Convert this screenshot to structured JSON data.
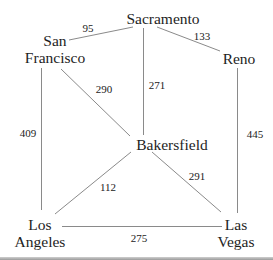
{
  "diagram": {
    "type": "weighted-graph",
    "nodes": {
      "sacramento": {
        "line1": "Sacramento",
        "line2": ""
      },
      "san_francisco": {
        "line1": "San",
        "line2": "Francisco"
      },
      "reno": {
        "line1": "Reno",
        "line2": ""
      },
      "bakersfield": {
        "line1": "Bakersfield",
        "line2": ""
      },
      "los_angeles": {
        "line1": "Los",
        "line2": "Angeles"
      },
      "las_vegas": {
        "line1": "Las",
        "line2": "Vegas"
      }
    },
    "edges": {
      "sf_sac": {
        "from": "San Francisco",
        "to": "Sacramento",
        "weight": "95"
      },
      "sac_reno": {
        "from": "Sacramento",
        "to": "Reno",
        "weight": "133"
      },
      "sf_bak": {
        "from": "San Francisco",
        "to": "Bakersfield",
        "weight": "290"
      },
      "sac_bak": {
        "from": "Sacramento",
        "to": "Bakersfield",
        "weight": "271"
      },
      "sf_la": {
        "from": "San Francisco",
        "to": "Los Angeles",
        "weight": "409"
      },
      "reno_lv": {
        "from": "Reno",
        "to": "Las Vegas",
        "weight": "445"
      },
      "la_bak": {
        "from": "Los Angeles",
        "to": "Bakersfield",
        "weight": "112"
      },
      "bak_lv": {
        "from": "Bakersfield",
        "to": "Las Vegas",
        "weight": "291"
      },
      "la_lv": {
        "from": "Los Angeles",
        "to": "Las Vegas",
        "weight": "275"
      }
    },
    "colors": {
      "edge": "#8a8a8a",
      "text": "#1e1e1e",
      "background": "#ffffff"
    }
  }
}
